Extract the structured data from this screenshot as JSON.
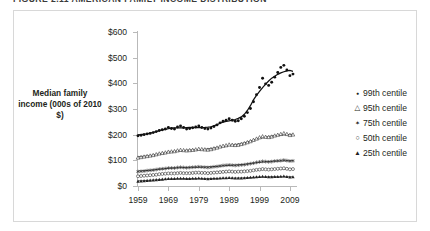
{
  "figure": {
    "title": "FIGURE 2.11  AMERICAN FAMILY INCOME DISTRIBUTION"
  },
  "axes": {
    "y_title": "Median family income (000s of 2010 $)",
    "y_ticks": [
      "$0",
      "$100",
      "$200",
      "$300",
      "$400",
      "$500",
      "$600"
    ],
    "x_ticks": [
      "1959",
      "1969",
      "1979",
      "1989",
      "1999",
      "2009"
    ]
  },
  "legend": {
    "items": [
      {
        "label": "99th centile",
        "marker": "filled-circle",
        "icon": "mk-dot"
      },
      {
        "label": "95th centile",
        "marker": "open-triangle",
        "icon": "mk-tri-open"
      },
      {
        "label": "75th centile",
        "marker": "star",
        "icon": "mk-star"
      },
      {
        "label": "50th centile",
        "marker": "open-circle",
        "icon": "mk-circ-open"
      },
      {
        "label": "25th centile",
        "marker": "filled-triangle",
        "icon": "mk-tri-fill"
      }
    ]
  },
  "chart_data": {
    "type": "scatter",
    "title": "FIGURE 2.11  AMERICAN FAMILY INCOME DISTRIBUTION",
    "xlabel": "",
    "ylabel": "Median family income (000s of 2010 $)",
    "xlim": [
      1959,
      2011
    ],
    "ylim": [
      0,
      600
    ],
    "ytick_values": [
      0,
      100,
      200,
      300,
      400,
      500,
      600
    ],
    "xtick_values": [
      1959,
      1969,
      1979,
      1989,
      1999,
      2009
    ],
    "grid": false,
    "legend_position": "right",
    "x": [
      1959,
      1960,
      1961,
      1962,
      1963,
      1964,
      1965,
      1966,
      1967,
      1968,
      1969,
      1970,
      1971,
      1972,
      1973,
      1974,
      1975,
      1976,
      1977,
      1978,
      1979,
      1980,
      1981,
      1982,
      1983,
      1984,
      1985,
      1986,
      1987,
      1988,
      1989,
      1990,
      1991,
      1992,
      1993,
      1994,
      1995,
      1996,
      1997,
      1998,
      1999,
      2000,
      2001,
      2002,
      2003,
      2004,
      2005,
      2006,
      2007,
      2008,
      2009,
      2010
    ],
    "series": [
      {
        "name": "99th centile",
        "marker": "filled-circle",
        "has_trend_line": true,
        "values": [
          196,
          198,
          200,
          203,
          205,
          208,
          212,
          216,
          219,
          222,
          228,
          224,
          222,
          230,
          234,
          228,
          222,
          224,
          227,
          230,
          234,
          228,
          224,
          222,
          226,
          232,
          238,
          246,
          252,
          256,
          262,
          256,
          252,
          254,
          262,
          272,
          286,
          302,
          328,
          356,
          384,
          420,
          398,
          392,
          404,
          424,
          442,
          462,
          470,
          452,
          430,
          436
        ]
      },
      {
        "name": "95th centile",
        "marker": "open-triangle",
        "has_trend_line": true,
        "values": [
          110,
          112,
          114,
          116,
          118,
          120,
          123,
          126,
          128,
          130,
          133,
          134,
          135,
          138,
          140,
          139,
          138,
          139,
          140,
          142,
          144,
          143,
          142,
          141,
          143,
          146,
          149,
          153,
          156,
          158,
          161,
          160,
          159,
          160,
          163,
          166,
          170,
          174,
          179,
          184,
          189,
          193,
          191,
          190,
          192,
          196,
          199,
          202,
          205,
          202,
          198,
          200
        ]
      },
      {
        "name": "75th centile",
        "marker": "star",
        "has_trend_line": true,
        "values": [
          56,
          57,
          58,
          60,
          61,
          62,
          64,
          66,
          67,
          68,
          70,
          70,
          70,
          72,
          73,
          72,
          71,
          72,
          73,
          74,
          75,
          74,
          73,
          72,
          73,
          75,
          76,
          78,
          80,
          81,
          82,
          81,
          80,
          81,
          82,
          83,
          85,
          87,
          89,
          92,
          94,
          96,
          95,
          94,
          95,
          97,
          98,
          99,
          101,
          99,
          97,
          98
        ]
      },
      {
        "name": "50th centile",
        "marker": "open-circle",
        "has_trend_line": true,
        "values": [
          38,
          39,
          40,
          41,
          42,
          43,
          44,
          46,
          47,
          48,
          49,
          49,
          49,
          50,
          51,
          50,
          50,
          50,
          51,
          52,
          52,
          51,
          51,
          50,
          51,
          52,
          53,
          54,
          55,
          56,
          57,
          56,
          55,
          56,
          56,
          57,
          58,
          59,
          61,
          63,
          64,
          66,
          65,
          64,
          65,
          66,
          67,
          68,
          69,
          67,
          65,
          66
        ]
      },
      {
        "name": "25th centile",
        "marker": "filled-triangle",
        "has_trend_line": true,
        "values": [
          18,
          19,
          20,
          21,
          22,
          23,
          24,
          25,
          26,
          27,
          28,
          28,
          28,
          29,
          29,
          29,
          28,
          28,
          29,
          29,
          30,
          29,
          28,
          27,
          28,
          29,
          29,
          30,
          31,
          31,
          32,
          31,
          30,
          30,
          30,
          31,
          32,
          33,
          34,
          35,
          36,
          37,
          36,
          35,
          35,
          36,
          36,
          37,
          38,
          36,
          34,
          35
        ]
      }
    ],
    "annotations": [
      "99th centile roughly flat near $200K from 1959 to about 1990, then rises steeply to about $470K by 2007 before dipping.",
      "95th, 75th, 50th and 25th centiles grow only modestly and remain tightly bunched below $210K."
    ]
  }
}
